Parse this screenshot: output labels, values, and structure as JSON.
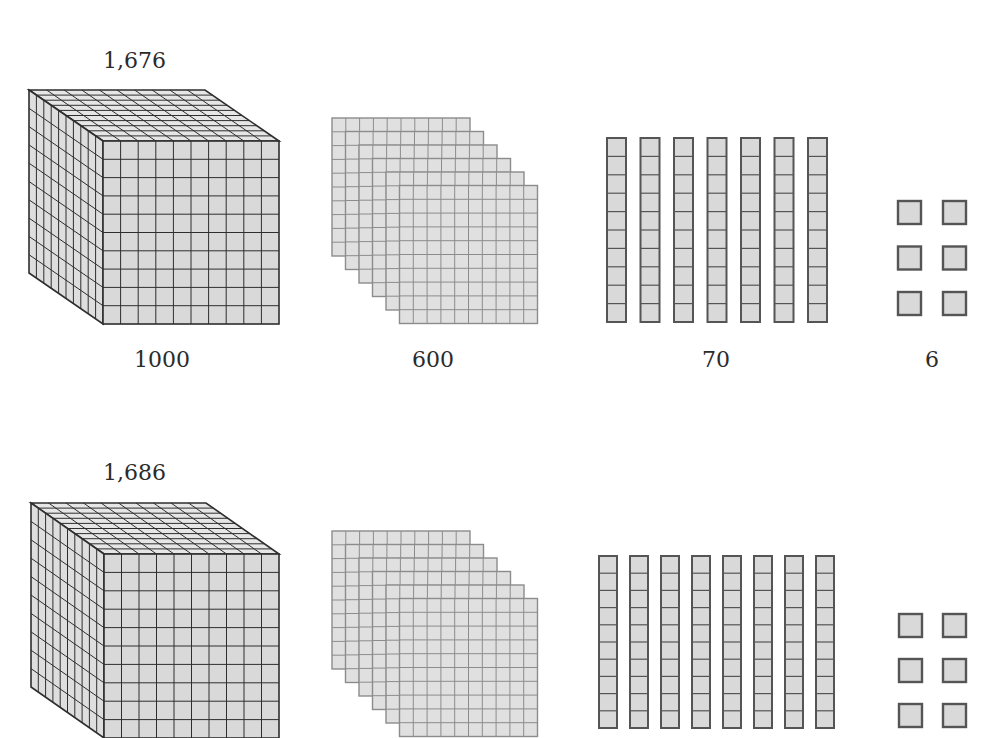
{
  "colors": {
    "block_fill": "#d9d9d9",
    "cube_top_fill": "#e6e6e6",
    "cube_side_fill": "#dedede",
    "cube_line": "#2e2e2e",
    "flat_fill": "#e0e0e0",
    "flat_line": "#8c8c8c",
    "rod_line": "#555555",
    "unit_line": "#555555"
  },
  "rows": [
    {
      "total_label": "1,676",
      "thousands": {
        "count": 1,
        "caption": "1000"
      },
      "hundreds": {
        "count": 6,
        "caption": "600"
      },
      "tens": {
        "count": 7,
        "caption": "70"
      },
      "ones": {
        "count": 6,
        "caption": "6"
      }
    },
    {
      "total_label": "1,686",
      "thousands": {
        "count": 1,
        "caption": ""
      },
      "hundreds": {
        "count": 6,
        "caption": ""
      },
      "tens": {
        "count": 8,
        "caption": ""
      },
      "ones": {
        "count": 6,
        "caption": ""
      }
    }
  ],
  "chart_data": {
    "type": "diagram",
    "items": [
      {
        "number": 1676,
        "label": "1,676",
        "thousands": 1,
        "hundreds": 6,
        "tens": 7,
        "ones": 6,
        "captions": [
          "1000",
          "600",
          "70",
          "6"
        ]
      },
      {
        "number": 1686,
        "label": "1,686",
        "thousands": 1,
        "hundreds": 6,
        "tens": 8,
        "ones": 6,
        "captions": []
      }
    ]
  }
}
